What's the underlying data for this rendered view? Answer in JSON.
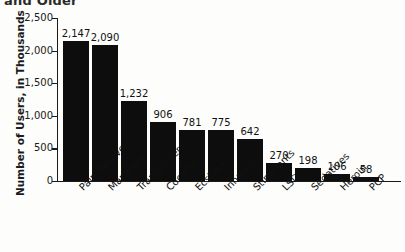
{
  "chart_data": {
    "type": "bar",
    "title": "and Older",
    "xlabel": "",
    "ylabel": "Number of Users, in Thousands",
    "ylim": [
      0,
      2500
    ],
    "ytick_labels": [
      "0",
      "500",
      "1,000",
      "1,500",
      "2,000",
      "2,500"
    ],
    "ytick_values": [
      0,
      500,
      1000,
      1500,
      2000,
      2500
    ],
    "grid": false,
    "legend": null,
    "bar_color": "#0d0d0d",
    "categories": [
      "Pain Relievers",
      "Marijuana",
      "Tranquilizers",
      "Cocaine",
      "Ecstasy",
      "Inhalants",
      "Stimulants",
      "LSD",
      "Sedatives",
      "Heroin",
      "PCP"
    ],
    "values": [
      2147,
      2090,
      1232,
      906,
      781,
      775,
      642,
      270,
      198,
      106,
      58
    ],
    "value_labels": [
      "2,147",
      "2,090",
      "1,232",
      "906",
      "781",
      "775",
      "642",
      "270",
      "198",
      "106",
      "58"
    ]
  }
}
